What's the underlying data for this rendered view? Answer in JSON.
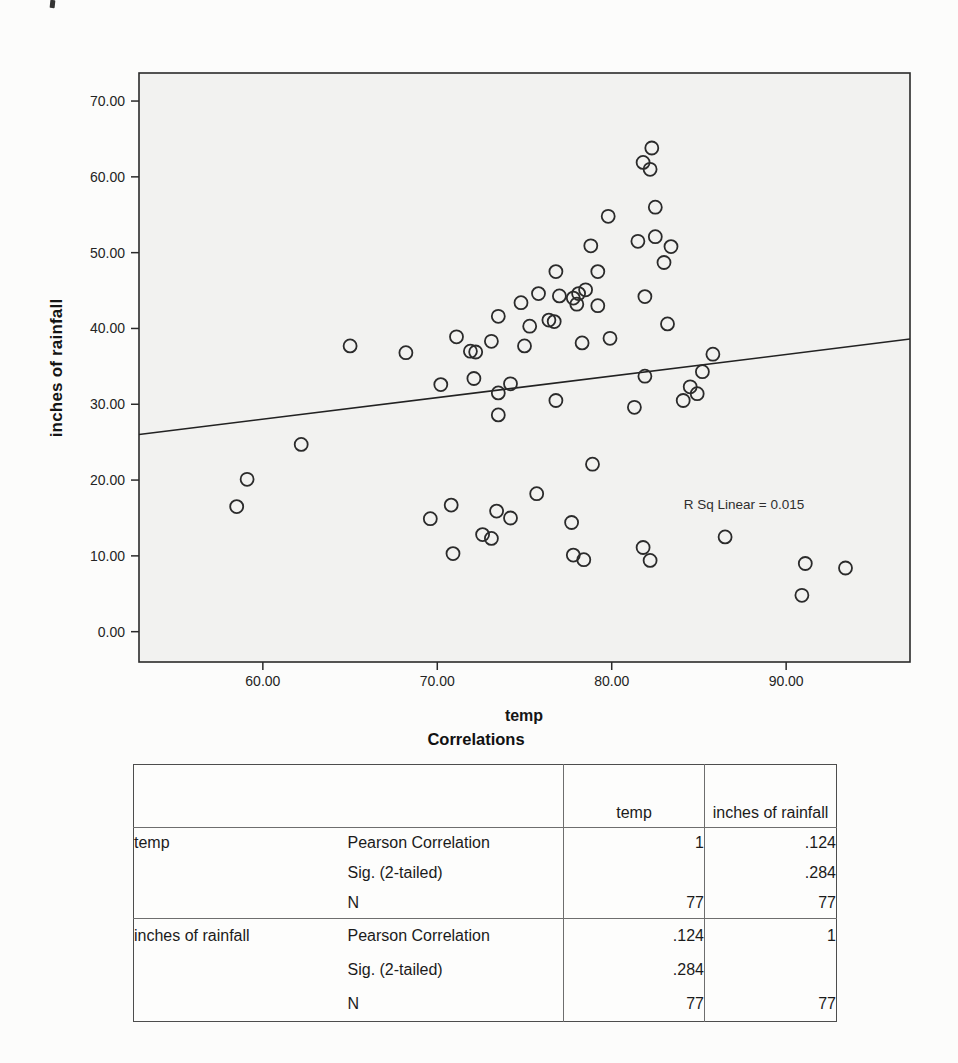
{
  "page": {
    "background": "#fcfcfb"
  },
  "chart_data": {
    "type": "scatter",
    "title": "",
    "xlabel": "temp",
    "ylabel": "inches of rainfall",
    "annotation": "R Sq Linear = 0.015",
    "xlim": [
      52.9,
      97.1
    ],
    "ylim": [
      -4.0,
      73.7
    ],
    "xticks": [
      60,
      70,
      80,
      90
    ],
    "xtick_labels": [
      "60.00",
      "70.00",
      "80.00",
      "90.00"
    ],
    "yticks": [
      0,
      10,
      20,
      30,
      40,
      50,
      60,
      70
    ],
    "ytick_labels": [
      "0.00",
      "10.00",
      "20.00",
      "30.00",
      "40.00",
      "50.00",
      "60.00",
      "70.00"
    ],
    "grid": false,
    "legend": "none",
    "points": [
      [
        82.3,
        63.8
      ],
      [
        81.8,
        61.9
      ],
      [
        82.2,
        61.0
      ],
      [
        82.5,
        56.0
      ],
      [
        79.8,
        54.8
      ],
      [
        81.5,
        51.5
      ],
      [
        82.5,
        52.1
      ],
      [
        78.8,
        50.9
      ],
      [
        79.2,
        47.5
      ],
      [
        76.8,
        47.5
      ],
      [
        81.9,
        44.2
      ],
      [
        75.8,
        44.6
      ],
      [
        77.0,
        44.3
      ],
      [
        77.8,
        44.0
      ],
      [
        78.1,
        44.6
      ],
      [
        78.5,
        45.1
      ],
      [
        78.0,
        43.2
      ],
      [
        79.2,
        43.0
      ],
      [
        74.8,
        43.4
      ],
      [
        73.5,
        41.6
      ],
      [
        76.4,
        41.1
      ],
      [
        76.7,
        40.9
      ],
      [
        75.3,
        40.3
      ],
      [
        71.1,
        38.9
      ],
      [
        73.1,
        38.3
      ],
      [
        75.0,
        37.7
      ],
      [
        71.9,
        37.0
      ],
      [
        72.2,
        36.9
      ],
      [
        78.3,
        38.1
      ],
      [
        79.9,
        38.7
      ],
      [
        65.0,
        37.7
      ],
      [
        68.2,
        36.8
      ],
      [
        83.4,
        50.8
      ],
      [
        83.0,
        48.7
      ],
      [
        83.2,
        40.6
      ],
      [
        85.8,
        36.6
      ],
      [
        70.2,
        32.6
      ],
      [
        72.1,
        33.4
      ],
      [
        73.5,
        31.5
      ],
      [
        74.2,
        32.7
      ],
      [
        73.5,
        28.6
      ],
      [
        62.2,
        24.7
      ],
      [
        59.1,
        20.1
      ],
      [
        58.5,
        16.5
      ],
      [
        69.6,
        14.9
      ],
      [
        70.8,
        16.7
      ],
      [
        73.4,
        15.9
      ],
      [
        74.2,
        15.0
      ],
      [
        72.6,
        12.8
      ],
      [
        73.1,
        12.3
      ],
      [
        70.9,
        10.3
      ],
      [
        76.8,
        30.5
      ],
      [
        81.9,
        33.7
      ],
      [
        85.2,
        34.3
      ],
      [
        84.5,
        32.3
      ],
      [
        84.9,
        31.4
      ],
      [
        84.1,
        30.5
      ],
      [
        81.3,
        29.6
      ],
      [
        78.9,
        22.1
      ],
      [
        75.7,
        18.2
      ],
      [
        77.7,
        14.4
      ],
      [
        77.8,
        10.1
      ],
      [
        78.4,
        9.5
      ],
      [
        81.8,
        11.1
      ],
      [
        82.2,
        9.4
      ],
      [
        86.5,
        12.5
      ],
      [
        91.1,
        9.0
      ],
      [
        93.4,
        8.4
      ],
      [
        90.9,
        4.8
      ]
    ],
    "fit_line": {
      "x1": 52.9,
      "y1": 26.0,
      "x2": 97.1,
      "y2": 38.6
    },
    "colors": {
      "plot_bg": "#f2f2f0",
      "axis": "#2a2a2a",
      "marker": "#2b2b2b",
      "fit_line": "#222222",
      "tick_text": "#242424"
    }
  },
  "table": {
    "title": "Correlations",
    "col_headers": {
      "temp": "temp",
      "rainfall": "inches of rainfall"
    },
    "rows": [
      {
        "group": "temp",
        "stat": "Pearson Correlation",
        "temp": "1",
        "rainfall": ".124"
      },
      {
        "group": "",
        "stat": "Sig. (2-tailed)",
        "temp": "",
        "rainfall": ".284"
      },
      {
        "group": "",
        "stat": "N",
        "temp": "77",
        "rainfall": "77"
      },
      {
        "group": "inches of rainfall",
        "stat": "Pearson Correlation",
        "temp": ".124",
        "rainfall": "1"
      },
      {
        "group": "",
        "stat": "Sig. (2-tailed)",
        "temp": ".284",
        "rainfall": ""
      },
      {
        "group": "",
        "stat": "N",
        "temp": "77",
        "rainfall": "77"
      }
    ]
  }
}
